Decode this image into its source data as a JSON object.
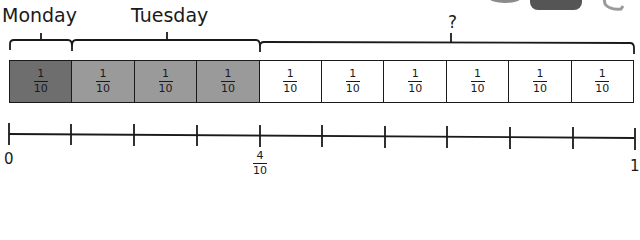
{
  "diagram": {
    "type": "bar-model-with-number-line",
    "labels": {
      "monday": "Monday",
      "tuesday": "Tuesday",
      "unknown": "?"
    },
    "bar": {
      "total_parts": 10,
      "cells": [
        {
          "numerator": "1",
          "denominator": "10",
          "shade": "#6e6e6e",
          "group": "monday"
        },
        {
          "numerator": "1",
          "denominator": "10",
          "shade": "#9a9a9a",
          "group": "tuesday"
        },
        {
          "numerator": "1",
          "denominator": "10",
          "shade": "#9a9a9a",
          "group": "tuesday"
        },
        {
          "numerator": "1",
          "denominator": "10",
          "shade": "#9a9a9a",
          "group": "tuesday"
        },
        {
          "numerator": "1",
          "denominator": "10",
          "shade": "#ffffff",
          "group": "unknown"
        },
        {
          "numerator": "1",
          "denominator": "10",
          "shade": "#ffffff",
          "group": "unknown"
        },
        {
          "numerator": "1",
          "denominator": "10",
          "shade": "#ffffff",
          "group": "unknown"
        },
        {
          "numerator": "1",
          "denominator": "10",
          "shade": "#ffffff",
          "group": "unknown"
        },
        {
          "numerator": "1",
          "denominator": "10",
          "shade": "#ffffff",
          "group": "unknown"
        },
        {
          "numerator": "1",
          "denominator": "10",
          "shade": "#ffffff",
          "group": "unknown"
        }
      ]
    },
    "number_line": {
      "start_label": "0",
      "mid_numerator": "4",
      "mid_denominator": "10",
      "end_label": "1",
      "ticks": 11
    },
    "colors": {
      "monday_fill": "#6e6e6e",
      "tuesday_fill": "#9a9a9a",
      "empty_fill": "#ffffff",
      "stroke": "#1a1a1a"
    }
  }
}
